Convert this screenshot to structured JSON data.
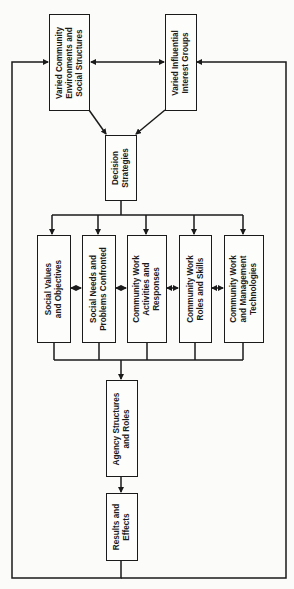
{
  "diagram": {
    "orientation": "rotated-90-ccw",
    "nodes": {
      "community_env": {
        "label": "Varied Community\nEnvironments and\nSocial Structures"
      },
      "interest_groups": {
        "label": "Varied Influential\nInterest Groups"
      },
      "decision": {
        "label": "Decision\nStrategies"
      },
      "values": {
        "label": "Social Values\nand Objectives"
      },
      "needs": {
        "label": "Social Needs and\nProblems Confronted"
      },
      "activities": {
        "label": "Community Work\nActivities and\nResponses"
      },
      "roles": {
        "label": "Community Work\nRoles and Skills"
      },
      "technologies": {
        "label": "Community Work\nand Management\nTechnologies"
      },
      "agency": {
        "label": "Agency Structures\nand Roles"
      },
      "results": {
        "label": "Results and\nEffects"
      }
    },
    "edges": [
      {
        "from": "community_env",
        "to": "interest_groups",
        "type": "bidirectional"
      },
      {
        "from": "community_env",
        "to": "decision",
        "type": "arrow"
      },
      {
        "from": "interest_groups",
        "to": "decision",
        "type": "arrow"
      },
      {
        "from": "decision",
        "to": "values",
        "type": "arrow"
      },
      {
        "from": "decision",
        "to": "needs",
        "type": "arrow"
      },
      {
        "from": "decision",
        "to": "activities",
        "type": "arrow"
      },
      {
        "from": "decision",
        "to": "roles",
        "type": "arrow"
      },
      {
        "from": "decision",
        "to": "technologies",
        "type": "arrow"
      },
      {
        "from": "values",
        "to": "needs",
        "type": "bidirectional"
      },
      {
        "from": "needs",
        "to": "activities",
        "type": "bidirectional"
      },
      {
        "from": "activities",
        "to": "roles",
        "type": "bidirectional"
      },
      {
        "from": "roles",
        "to": "technologies",
        "type": "bidirectional"
      },
      {
        "from": "values+needs+activities+roles+technologies",
        "to": "agency",
        "type": "arrow"
      },
      {
        "from": "agency",
        "to": "results",
        "type": "arrow"
      },
      {
        "from": "results",
        "to": "community_env",
        "type": "feedback-loop"
      },
      {
        "from": "results",
        "to": "interest_groups",
        "type": "feedback-loop"
      }
    ],
    "colors": {
      "line": "#1a1a1a",
      "background": "#fbfbf9"
    }
  }
}
